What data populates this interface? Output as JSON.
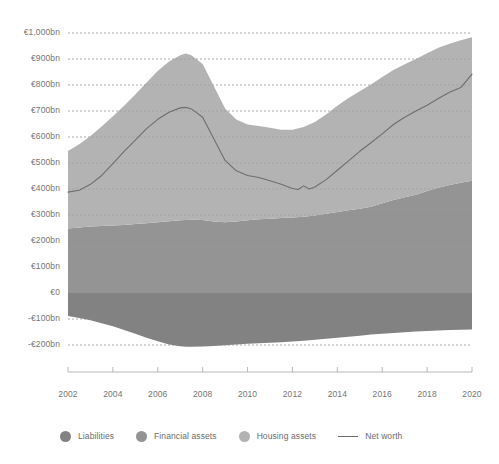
{
  "chart_data": {
    "type": "area",
    "title": "",
    "subtitle": "",
    "xlabel": "",
    "ylabel": "",
    "stacked": true,
    "grid": true,
    "legend_position": "bottom",
    "xlim": [
      2002,
      2020
    ],
    "ylim": [
      -200,
      1000
    ],
    "y_tick_labels": [
      "€1,000bn",
      "€900bn",
      "€800bn",
      "€700bn",
      "€600bn",
      "€500bn",
      "€400bn",
      "€300bn",
      "€200bn",
      "€100bn",
      "€0",
      "-€100bn",
      "-€200bn"
    ],
    "y_tick_values": [
      1000,
      900,
      800,
      700,
      600,
      500,
      400,
      300,
      200,
      100,
      0,
      -100,
      -200
    ],
    "x_tick_labels": [
      "2002",
      "2004",
      "2006",
      "2008",
      "2010",
      "2012",
      "2014",
      "2016",
      "2018",
      "2020"
    ],
    "x_tick_values": [
      2002,
      2004,
      2006,
      2008,
      2010,
      2012,
      2014,
      2016,
      2018,
      2020
    ],
    "x": [
      2002,
      2002.5,
      2003,
      2003.5,
      2004,
      2004.5,
      2005,
      2005.5,
      2006,
      2006.5,
      2007,
      2007.25,
      2007.5,
      2008,
      2008.5,
      2009,
      2009.5,
      2010,
      2010.5,
      2011,
      2011.5,
      2012,
      2012.5,
      2013,
      2013.5,
      2014,
      2014.5,
      2015,
      2015.5,
      2016,
      2016.5,
      2017,
      2017.5,
      2018,
      2018.5,
      2019,
      2019.5,
      2020
    ],
    "series": [
      {
        "name": "Liabilities",
        "color": "#828282",
        "values": [
          -88,
          -96,
          -105,
          -116,
          -128,
          -142,
          -157,
          -172,
          -186,
          -198,
          -205,
          -207,
          -207,
          -206,
          -204,
          -201,
          -198,
          -195,
          -193,
          -191,
          -189,
          -187,
          -184,
          -180,
          -176,
          -172,
          -168,
          -164,
          -160,
          -157,
          -154,
          -151,
          -148,
          -146,
          -144,
          -142,
          -141,
          -140
        ]
      },
      {
        "name": "Financial assets",
        "color": "#949494",
        "values": [
          248,
          252,
          256,
          258,
          260,
          262,
          265,
          268,
          272,
          276,
          280,
          281,
          282,
          281,
          275,
          272,
          275,
          280,
          284,
          286,
          288,
          290,
          293,
          298,
          305,
          312,
          318,
          324,
          332,
          345,
          358,
          368,
          378,
          392,
          405,
          415,
          424,
          432
        ]
      },
      {
        "name": "Housing assets",
        "color": "#b3b3b3",
        "values": [
          298,
          320,
          348,
          382,
          420,
          458,
          498,
          542,
          582,
          614,
          634,
          640,
          632,
          600,
          520,
          438,
          392,
          368,
          358,
          350,
          340,
          338,
          345,
          360,
          382,
          408,
          432,
          452,
          470,
          486,
          500,
          512,
          522,
          530,
          538,
          544,
          548,
          552
        ]
      }
    ],
    "line_series": {
      "name": "Net worth",
      "color": "#6e6e6e",
      "x": [
        2002,
        2002.5,
        2003,
        2003.5,
        2004,
        2004.5,
        2005,
        2005.5,
        2006,
        2006.5,
        2007,
        2007.25,
        2007.5,
        2008,
        2008.5,
        2009,
        2009.5,
        2010,
        2010.5,
        2011,
        2011.5,
        2012,
        2012.25,
        2012.5,
        2012.75,
        2013,
        2013.5,
        2014,
        2014.5,
        2015,
        2015.5,
        2016,
        2016.5,
        2017,
        2017.5,
        2018,
        2018.5,
        2019,
        2019.5,
        2020
      ],
      "values": [
        388,
        395,
        418,
        452,
        498,
        545,
        588,
        632,
        668,
        695,
        712,
        714,
        708,
        676,
        592,
        510,
        470,
        452,
        444,
        432,
        418,
        402,
        398,
        412,
        400,
        408,
        436,
        472,
        508,
        545,
        578,
        612,
        648,
        676,
        700,
        722,
        748,
        772,
        790,
        842
      ]
    }
  },
  "legend": {
    "items": [
      {
        "label": "Liabilities",
        "marker": "circle",
        "color": "#828282"
      },
      {
        "label": "Financial assets",
        "marker": "circle",
        "color": "#949494"
      },
      {
        "label": "Housing assets",
        "marker": "circle",
        "color": "#b3b3b3"
      },
      {
        "label": "Net worth",
        "marker": "line",
        "color": "#6e6e6e"
      }
    ]
  },
  "colors": {
    "background": "#ffffff",
    "grid": "#b9b9b9",
    "axis": "#b0b0b0",
    "text": "#757575"
  }
}
